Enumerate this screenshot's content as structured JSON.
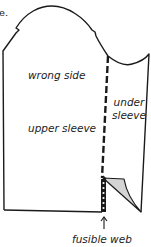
{
  "figure": {
    "cropped_text": "e.",
    "labels": {
      "wrong_side": "wrong side",
      "upper_sleeve": "upper sleeve",
      "under_sleeve_line1": "under",
      "under_sleeve_line2": "sleeve",
      "fusible_web": "fusible web"
    },
    "colors": {
      "stroke": "#1a1a1a",
      "fold_fill": "#d4d4d4",
      "background": "#ffffff"
    }
  }
}
